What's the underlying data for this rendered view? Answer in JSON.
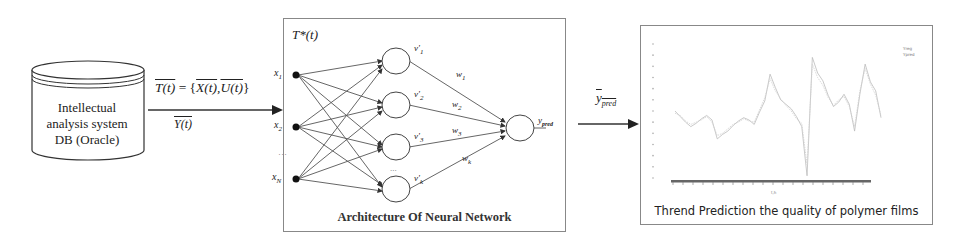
{
  "database": {
    "lines": [
      "Intellectual",
      "analysis system",
      "DB (Oracle)"
    ]
  },
  "arrow1": {
    "label_top": "T(t) = {X(t),U(t)}",
    "label_top_parts": {
      "t": "T(t)",
      "eq": " = {",
      "x": "X(t)",
      "comma": ",",
      "u": "U(t)",
      "close": "}"
    },
    "label_bottom": "Y(t)"
  },
  "neural_network": {
    "header": "T*(t)",
    "title": "Architecture Of Neural Network",
    "inputs": [
      "x1",
      "x2",
      "...",
      "xN"
    ],
    "input_labels": [
      {
        "base": "x",
        "sub": "1"
      },
      {
        "base": "x",
        "sub": "2"
      },
      {
        "base": "…",
        "sub": ""
      },
      {
        "base": "x",
        "sub": "N"
      }
    ],
    "hidden_labels": [
      {
        "base": "v'",
        "sub": "1"
      },
      {
        "base": "v'",
        "sub": "2"
      },
      {
        "base": "v'",
        "sub": "3"
      },
      {
        "base": "v'",
        "sub": "k"
      }
    ],
    "weight_labels": [
      {
        "base": "w",
        "sub": "1"
      },
      {
        "base": "w",
        "sub": "2"
      },
      {
        "base": "w",
        "sub": "3"
      },
      {
        "base": "w",
        "sub": "k"
      }
    ],
    "hidden_ellipsis": "...",
    "output_label": {
      "base": "y",
      "sub": "pred"
    }
  },
  "arrow2": {
    "label": "y pred",
    "label_parts": {
      "base": "y",
      "sub": "pred"
    }
  },
  "chart_panel": {
    "caption": "Thrend Prediction the quality of polymer films",
    "xlabel": "t,h",
    "legend": [
      "Yreg",
      "Ypred"
    ]
  },
  "chart_data": {
    "type": "line",
    "title": "Thrend Prediction the quality of polymer films",
    "xlabel": "t,h",
    "ylabel": "",
    "legend": [
      "Yreg",
      "Ypred"
    ],
    "grid": false,
    "x": [
      1,
      2,
      3,
      4,
      5,
      6,
      7,
      8,
      9,
      10,
      11,
      12,
      13,
      14,
      15,
      16,
      17,
      18,
      19,
      20,
      21,
      22,
      23,
      24,
      25,
      26,
      27,
      28,
      29,
      30,
      31,
      32,
      33,
      34,
      35,
      36,
      37,
      38,
      39,
      40
    ],
    "series": [
      {
        "name": "Yreg",
        "values": [
          6,
          5.5,
          5,
          4.6,
          4.9,
          5.3,
          5.6,
          5.2,
          3.5,
          3.9,
          4.2,
          4.7,
          5.1,
          5.4,
          5.2,
          4.8,
          5.9,
          6.9,
          9.3,
          8.1,
          7.0,
          6.6,
          6.2,
          5.5,
          4.6,
          0.2,
          10.8,
          9.4,
          8.7,
          7.4,
          6.4,
          6.8,
          7.5,
          6.6,
          4.2,
          7.5,
          10.2,
          8.6,
          7.8,
          5.4
        ]
      },
      {
        "name": "Ypred",
        "values": [
          5.8,
          5.6,
          5.1,
          4.8,
          5.0,
          5.2,
          5.5,
          5.0,
          3.8,
          4.0,
          4.4,
          4.8,
          5.0,
          5.3,
          5.1,
          5.0,
          6.1,
          7.2,
          8.9,
          7.8,
          7.1,
          6.5,
          6.0,
          5.3,
          4.9,
          1.2,
          10.2,
          9.0,
          8.3,
          7.2,
          6.5,
          7.0,
          7.3,
          6.4,
          4.6,
          7.8,
          9.8,
          8.4,
          7.4,
          5.6
        ]
      }
    ],
    "ylim": [
      0,
      12
    ]
  }
}
